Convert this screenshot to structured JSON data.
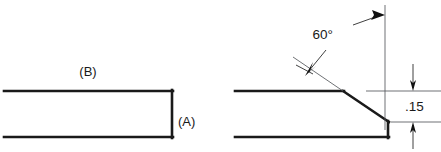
{
  "drawing": {
    "title": "Chamfer detail comparison",
    "background_color": "#ffffff",
    "line_color": "#1a1a1a",
    "thin_line_color": "#55585c",
    "labels": {
      "part_a": "(A)",
      "part_b": "(B)",
      "angle_dimension": "60°",
      "height_dimension": ".15"
    },
    "left_view": {
      "name": "square-end-bar",
      "description": "Rectangular bar with square end",
      "top_edge_y": 91,
      "bottom_edge_y": 137,
      "left_x": 4,
      "right_x": 173,
      "label_b_position": {
        "x": 88,
        "y": 76
      },
      "label_a_position": {
        "x": 178,
        "y": 126
      }
    },
    "right_view": {
      "name": "chamfered-end-bar",
      "description": "Rectangular bar with 60 degree chamfer at end",
      "top_edge_y": 91,
      "bottom_edge_y": 137,
      "left_x": 235,
      "chamfer_start_x": 343,
      "chamfer_end_x": 389,
      "chamfer_end_y": 122,
      "right_x": 389
    },
    "dimensions": {
      "angle": {
        "name": "chamfer-angle",
        "value": "60°",
        "text_position": {
          "x": 333,
          "y": 39
        }
      },
      "height": {
        "name": "chamfer-height",
        "value": ".15",
        "text_position": {
          "x": 419,
          "y": 111
        },
        "upper_extension_y": 91,
        "lower_extension_y": 122,
        "dim_line_x": 413
      },
      "reference_vertical_line_x": 385
    }
  }
}
